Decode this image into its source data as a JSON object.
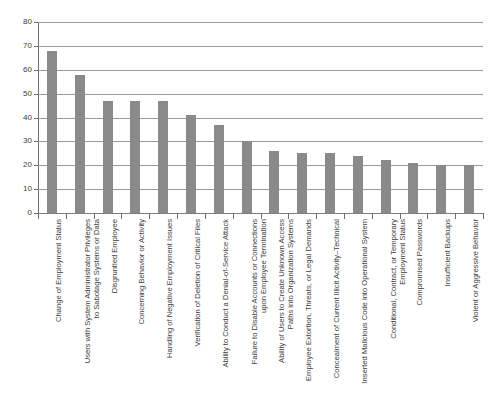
{
  "chart_data": {
    "type": "bar",
    "title": "",
    "subtitle": "",
    "xlabel": "",
    "ylabel": "",
    "ylim": [
      0,
      80
    ],
    "ytick_step": 10,
    "yticks": [
      0,
      10,
      20,
      30,
      40,
      50,
      60,
      70,
      80
    ],
    "ytick_labels": [
      "0",
      "10",
      "20",
      "30",
      "40",
      "50",
      "60",
      "70",
      "80"
    ],
    "grid": true,
    "grid_axis": "y",
    "legend": false,
    "legend_position": "none",
    "bar_color": "#8a8a8a",
    "gridline_color": "#9a9a9a",
    "axis_color": "#6e6e6e",
    "categories": [
      "Change of Employment Status",
      "Users with System Administrator Privileges to Sabotage Systems or Data",
      "Disgruntled Employee",
      "Concerning Behavior or Activity",
      "Handling of Negative Employment Issues",
      "Verification of Deletion of Critical Files",
      "Ability to Conduct a Denial-of-Service Attack",
      "Failure to Disable Accounts or Connections upon Employee Termination",
      "Ability of Users to Create Unknown Access Paths into Organization Systems",
      "Employee Extortion, Threats, or Legal Demands",
      "Concealment of Current Illicit Activity–Technical",
      "Inserted Malicious Code into Operational System",
      "Conditional, Contract, or Temporary Employment Status",
      "Compromised Passwords",
      "Insufficient Backups",
      "Violent or Aggressive Behavior"
    ],
    "category_lines": [
      [
        "Change of Employment Status"
      ],
      [
        "Users with System Administrator Privileges",
        "to Sabotage Systems or Data"
      ],
      [
        "Disgruntled Employee"
      ],
      [
        "Concerning Behavior or Activity"
      ],
      [
        "Handling of Negative Employment Issues"
      ],
      [
        "Verification of Deletion of Critical Files"
      ],
      [
        "Ability to Conduct a Denial-of-Service Attack"
      ],
      [
        "Failure to Disable Accounts or Connections",
        "upon Employee Termination"
      ],
      [
        "Ability of Users to Create Unknown Access",
        "Paths into Organization Systems"
      ],
      [
        "Employee Extortion, Threats, or Legal Demands"
      ],
      [
        "Concealment of Current Illicit Activity–Technical"
      ],
      [
        "Inserted Malicious Code into Operational System"
      ],
      [
        "Conditional, Contract, or Temporary",
        "Employment Status"
      ],
      [
        "Compromised Passwords"
      ],
      [
        "Insufficient Backups"
      ],
      [
        "Violent or Aggressive Behavior"
      ]
    ],
    "values": [
      68,
      58,
      47,
      47,
      47,
      41,
      37,
      30,
      26,
      25,
      25,
      24,
      22,
      21,
      20,
      20
    ]
  }
}
